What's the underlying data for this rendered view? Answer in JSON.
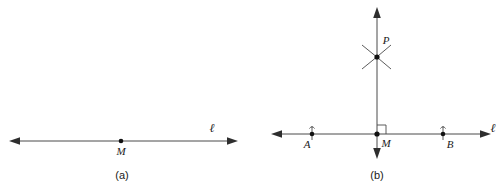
{
  "figure": {
    "background_color": "#ffffff",
    "stroke_color": "#4a4a4a",
    "point_color": "#111111",
    "label_color": "#1a1a1a",
    "width": 501,
    "height": 192
  },
  "panel_a": {
    "caption": "(a)",
    "line_label": "ℓ",
    "points": [
      {
        "label": "M",
        "x": 121,
        "y": 141
      }
    ],
    "line": {
      "name": "line-l",
      "x1": 10,
      "y1": 141,
      "x2": 237,
      "y2": 141,
      "arrow_left": true,
      "arrow_right": true
    },
    "line_label_position": {
      "x": 212,
      "y": 129
    },
    "caption_position": {
      "x": 122,
      "y": 178
    }
  },
  "panel_b": {
    "caption": "(b)",
    "line_label_horizontal": "ℓ",
    "points": [
      {
        "label": "A",
        "x": 312,
        "y": 134,
        "has_tick": true
      },
      {
        "label": "M",
        "x": 377,
        "y": 134,
        "has_tick": false
      },
      {
        "label": "B",
        "x": 443,
        "y": 134,
        "has_tick": true
      },
      {
        "label": "P",
        "x": 377,
        "y": 57,
        "has_tick": false
      }
    ],
    "horizontal_line": {
      "name": "line-l",
      "x1": 272,
      "y1": 134,
      "x2": 490,
      "y2": 134,
      "arrow_left": true,
      "arrow_right": true
    },
    "vertical_line": {
      "name": "perpendicular-line",
      "x1": 377,
      "y1": 8,
      "x2": 377,
      "y2": 158,
      "arrow_top": true,
      "arrow_bottom": true
    },
    "arcs_at_p": {
      "description": "two intersecting construction arcs crossing at P",
      "count": 2
    },
    "right_angle_marker": {
      "label": "right angle at M",
      "size": 8,
      "quadrant": "upper-right"
    },
    "line_label_position": {
      "x": 492,
      "y": 129
    },
    "caption_position": {
      "x": 377,
      "y": 178
    }
  }
}
